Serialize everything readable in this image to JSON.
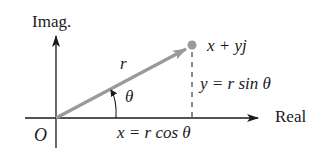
{
  "diagram": {
    "axes": {
      "vertical_label": "Imag.",
      "horizontal_label": "Real",
      "origin_label": "O"
    },
    "vector": {
      "label": "r",
      "angle_label": "θ",
      "point_label": "x + yj",
      "color": "#9a9a9a"
    },
    "projections": {
      "vertical": "y = r sin θ",
      "horizontal": "x = r cos θ"
    },
    "colors": {
      "axis": "#1a1a1a",
      "vector": "#9a9a9a",
      "text": "#1a1a1a"
    }
  }
}
